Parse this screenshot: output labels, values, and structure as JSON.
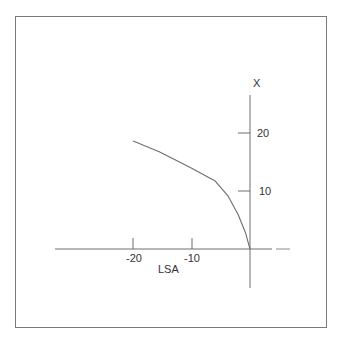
{
  "chart_data": {
    "type": "line",
    "title": "",
    "xlabel": "LSA",
    "ylabel": "X",
    "xlim": [
      -20,
      0
    ],
    "ylim": [
      0,
      25
    ],
    "x_ticks": [
      -20,
      -10
    ],
    "x_tick_labels": [
      "-20",
      "-10"
    ],
    "y_ticks": [
      10,
      20
    ],
    "y_tick_labels": [
      "10",
      "20"
    ],
    "grid": false,
    "legend": null,
    "series": [
      {
        "name": "LSA vs X",
        "x": [
          -19.8,
          -15.3,
          -10.2,
          -5.9,
          -3.7,
          -2.0,
          -0.8,
          0
        ],
        "y": [
          18.6,
          16.7,
          14.1,
          11.7,
          9.1,
          5.9,
          2.9,
          0
        ]
      }
    ]
  },
  "labels": {
    "x_axis": "LSA",
    "y_axis": "X",
    "x_tick_neg20": "-20",
    "x_tick_neg10": "-10",
    "y_tick_10": "10",
    "y_tick_20": "20"
  },
  "colors": {
    "axis": "#6e6e6e",
    "curve": "#6e6e6e",
    "frame": "#7a7a7a",
    "text": "#333333"
  }
}
